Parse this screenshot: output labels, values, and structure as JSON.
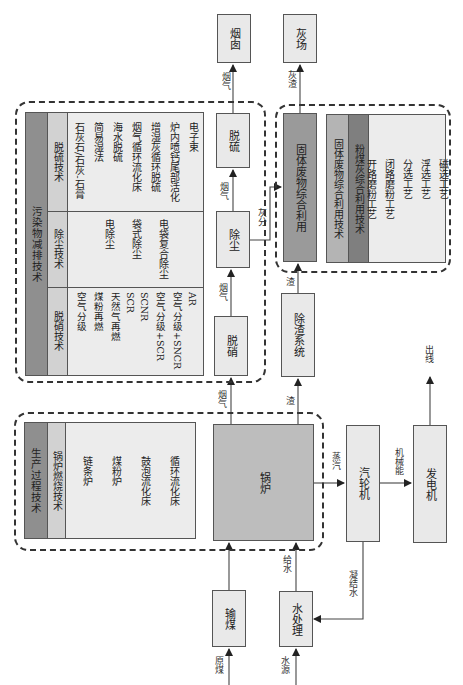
{
  "terminals": {
    "chimney": "烟囱",
    "ash_yard": "灰场",
    "output": "出线"
  },
  "process_boxes": {
    "desulfurization": "脱硫",
    "dedusting": "除尘",
    "denitrification": "脱硝",
    "slag_removal": "除渣系统",
    "solid_waste": "固体废物综合利用",
    "boiler": "锅炉",
    "turbine": "汽轮机",
    "generator": "发电机",
    "coal_transport": "输煤",
    "water_treatment": "水处理"
  },
  "flow_labels": {
    "flue_gas_to_chimney": "烟气",
    "ash_slag_to_yard": "灰渣",
    "flue_gas_to_desulf": "烟气",
    "ash": "灰分",
    "flue_gas_to_dedust": "烟气",
    "slag": "渣",
    "flue_gas_from_boiler": "烟气",
    "slag_from_boiler": "渣",
    "steam": "蒸汽",
    "mechanical_energy": "机械能",
    "feed_water": "给水",
    "condensate": "凝结水",
    "raw_coal": "原煤",
    "water_source": "水源"
  },
  "pollutant_table": {
    "title": "污染物减排技术",
    "rows": [
      {
        "header": "脱硫技术",
        "items": [
          "石灰石/石灰-石膏",
          "简易湿法",
          "海水脱硫",
          "烟气循环流化床",
          "增湿灰循环脱硫",
          "炉内喷钙尾部活化",
          "电子束"
        ]
      },
      {
        "header": "除尘技术",
        "items": [
          "电除尘",
          "袋式除尘",
          "电袋复合除尘"
        ]
      },
      {
        "header": "脱硝技术",
        "items": [
          "空气分级",
          "煤粉再燃",
          "天然气再燃",
          "SCR",
          "SCNR",
          "空气分级+SCR",
          "空气分级+SNCR",
          "AR"
        ]
      }
    ]
  },
  "production_table": {
    "title": "生产过程技术",
    "header": "锅炉燃烧技术",
    "items": [
      "链条炉",
      "煤粉炉",
      "鼓泡流化床",
      "循环流化床"
    ]
  },
  "solid_waste_table": {
    "title": "固体废物综合利用技术",
    "header": "粉煤灰综合利用技术",
    "items": [
      "开路磨粉工艺",
      "闭路磨粉工艺",
      "分选工艺",
      "浮选工艺",
      "磁选工艺"
    ]
  }
}
